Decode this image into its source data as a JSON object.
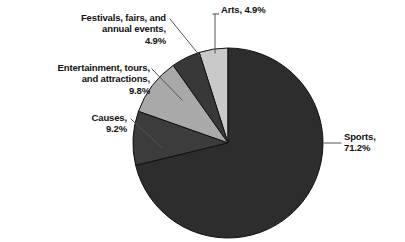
{
  "chart_data": {
    "type": "pie",
    "title": "",
    "subtitle": "",
    "xlabel": "",
    "ylabel": "",
    "grid": false,
    "legend_position": "none",
    "labels_position": "callout",
    "units": "percent",
    "start_angle_deg": 90,
    "direction": "counterclockwise",
    "categories": [
      "Arts",
      "Festivals, fairs, and annual events",
      "Entertainment, tours, and attractions",
      "Causes",
      "Sports"
    ],
    "values": [
      4.9,
      4.9,
      9.8,
      9.2,
      71.2
    ],
    "colors": [
      "#c9c9c9",
      "#383838",
      "#a9a9a9",
      "#3c3c3c",
      "#2d2d2d"
    ],
    "slices": [
      {
        "name": "Arts",
        "value": 4.9,
        "value_text": "4.9%",
        "color": "#c9c9c9"
      },
      {
        "name": "Festivals, fairs, and annual events",
        "value": 4.9,
        "value_text": "4.9%",
        "color": "#383838"
      },
      {
        "name": "Entertainment, tours, and attractions",
        "value": 9.8,
        "value_text": "9.8%",
        "color": "#a9a9a9"
      },
      {
        "name": "Causes",
        "value": 9.2,
        "value_text": "9.2%",
        "color": "#3c3c3c"
      },
      {
        "name": "Sports",
        "value": 71.2,
        "value_text": "71.2%",
        "color": "#2d2d2d"
      }
    ]
  },
  "labels": {
    "festivals": "Festivals, fairs, and\nannual events,\n4.9%",
    "entertainment": "Entertainment, tours,\nand attractions,\n9.8%",
    "causes": "Causes,\n9.2%",
    "arts": "Arts, 4.9%",
    "sports": "Sports,\n71.2%"
  },
  "style": {
    "background": "#ffffff",
    "text_color": "#111111",
    "leader_line_color": "#555555",
    "slice_outline_color": "#000000"
  }
}
